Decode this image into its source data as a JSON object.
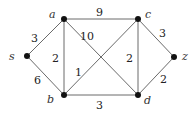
{
  "graph": {
    "nodes": [
      {
        "id": "s",
        "label": "s",
        "x": 27,
        "y": 56,
        "lx": 9,
        "ly": 60
      },
      {
        "id": "a",
        "label": "a",
        "x": 64,
        "y": 19,
        "lx": 49,
        "ly": 18
      },
      {
        "id": "b",
        "label": "b",
        "x": 64,
        "y": 95,
        "lx": 47,
        "ly": 103
      },
      {
        "id": "c",
        "label": "c",
        "x": 138,
        "y": 19,
        "lx": 145,
        "ly": 18
      },
      {
        "id": "d",
        "label": "d",
        "x": 138,
        "y": 95,
        "lx": 144,
        "ly": 104
      },
      {
        "id": "z",
        "label": "z",
        "x": 174,
        "y": 57,
        "lx": 182,
        "ly": 60
      }
    ],
    "edges": [
      {
        "from": "s",
        "to": "a",
        "weight": "3",
        "lx": 31,
        "ly": 42
      },
      {
        "from": "s",
        "to": "b",
        "weight": "6",
        "lx": 34,
        "ly": 84
      },
      {
        "from": "a",
        "to": "b",
        "weight": "2",
        "lx": 52,
        "ly": 62
      },
      {
        "from": "a",
        "to": "c",
        "weight": "9",
        "lx": 96,
        "ly": 16
      },
      {
        "from": "a",
        "to": "d",
        "weight": "10",
        "lx": 80,
        "ly": 40
      },
      {
        "from": "b",
        "to": "c",
        "weight": "1",
        "lx": 75,
        "ly": 76
      },
      {
        "from": "b",
        "to": "d",
        "weight": "3",
        "lx": 96,
        "ly": 109
      },
      {
        "from": "c",
        "to": "d",
        "weight": "2",
        "lx": 126,
        "ly": 62
      },
      {
        "from": "c",
        "to": "z",
        "weight": "3",
        "lx": 159,
        "ly": 37
      },
      {
        "from": "d",
        "to": "z",
        "weight": "2",
        "lx": 160,
        "ly": 83
      }
    ]
  }
}
